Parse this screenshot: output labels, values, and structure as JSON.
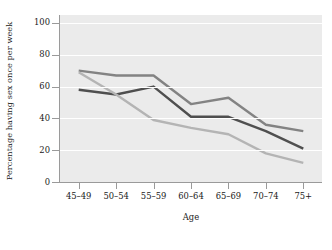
{
  "chart_data": {
    "type": "line",
    "title": "",
    "xlabel": "Age",
    "ylabel": "Percentage having sex once per week",
    "categories": [
      "45–49",
      "50–54",
      "55–59",
      "60–64",
      "65–69",
      "70–74",
      "75+"
    ],
    "yticks": [
      0,
      20,
      40,
      60,
      80,
      100
    ],
    "ytick_labels": [
      "0",
      "20",
      "40",
      "60",
      "80",
      "100"
    ],
    "ylim": [
      0,
      105
    ],
    "grid": "horizontal-white",
    "legend": "none",
    "plot_background": "#ebebeb",
    "series": [
      {
        "name": "series-dark",
        "color": "#4f4f4f",
        "values": [
          58,
          55,
          60,
          41,
          41,
          32,
          21
        ]
      },
      {
        "name": "series-medium",
        "color": "#838383",
        "values": [
          70,
          67,
          67,
          49,
          53,
          36,
          32
        ]
      },
      {
        "name": "series-light",
        "color": "#b4b4b4",
        "values": [
          69,
          55,
          39,
          34,
          30,
          18,
          12
        ]
      }
    ]
  },
  "axis": {
    "x_title": "Age",
    "y_title": "Percentage having sex once per week"
  }
}
